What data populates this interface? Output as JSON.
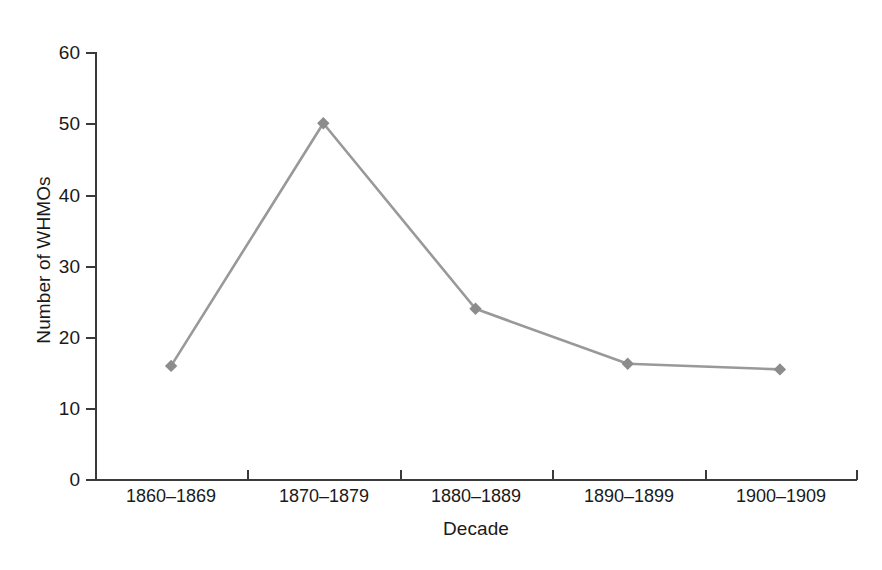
{
  "chart_data": {
    "type": "line",
    "title": "",
    "xlabel": "Decade",
    "ylabel": "Number of WHMOs",
    "categories": [
      "1860–1869",
      "1870–1879",
      "1880–1889",
      "1890–1899",
      "1900–1909"
    ],
    "values": [
      16,
      50,
      24,
      16.3,
      15.5
    ],
    "series": [
      {
        "name": "Number of WHMOs",
        "values": [
          16,
          50,
          24,
          16.3,
          15.5
        ]
      }
    ],
    "ylim": [
      0,
      60
    ],
    "ytick_values": [
      0,
      10,
      20,
      30,
      40,
      50,
      60
    ],
    "ytick_labels": [
      "0",
      "10",
      "20",
      "30",
      "40",
      "50",
      "60"
    ],
    "grid": false,
    "legend": "none",
    "marker": "diamond",
    "line_color": "#999999",
    "marker_color": "#8c8c8c",
    "axis_color": "#3a3a3a",
    "background": "#ffffff"
  }
}
